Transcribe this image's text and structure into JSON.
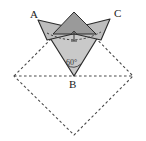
{
  "figure": {
    "canvas": {
      "width": 146,
      "height": 141,
      "background": "#ffffff"
    },
    "labels": {
      "vertex_a": "A",
      "vertex_b": "B",
      "vertex_c": "C",
      "angle_b": "60°"
    },
    "colors": {
      "stroke": "#2b2b2b",
      "dashed_stroke": "#4a4a4a",
      "cone_fill": "#c9c9c9",
      "wing_fill": "#bdbdbd",
      "cap_fill": "#9a9a9a",
      "label_color": "#1a1a1a"
    },
    "geometry": {
      "square_vertices": [
        {
          "name": "left",
          "x": 14,
          "y": 76
        },
        {
          "name": "top",
          "x": 74,
          "y": 16
        },
        {
          "name": "right",
          "x": 133,
          "y": 76
        },
        {
          "name": "bottom",
          "x": 74,
          "y": 135
        }
      ],
      "apex_b": {
        "x": 74,
        "y": 76
      },
      "point_a": {
        "x": 38,
        "y": 20
      },
      "point_c": {
        "x": 110,
        "y": 19
      },
      "rim_left": {
        "x": 47,
        "y": 33
      },
      "rim_right": {
        "x": 101,
        "y": 32
      },
      "cap_apex": {
        "x": 74,
        "y": 12
      },
      "center_mark": {
        "x": 74,
        "y": 35
      }
    },
    "angle_value": 60,
    "angle_unit": "degrees"
  }
}
